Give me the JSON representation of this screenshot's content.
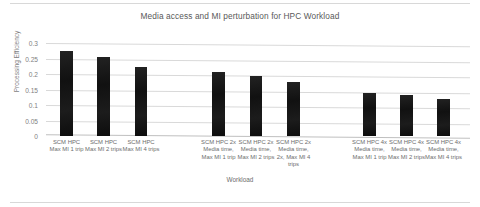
{
  "chart_data": {
    "type": "bar",
    "title": "Media access and MI perturbation for HPC Workload",
    "xlabel": "Workload",
    "ylabel": "Processing Efficiency",
    "ylim": [
      0,
      0.3
    ],
    "ytick_labels": [
      "0.3",
      "0.25",
      "0.2",
      "0.15",
      "0.1",
      "0.05",
      "0"
    ],
    "ytick_values": [
      0.3,
      0.25,
      0.2,
      0.15,
      0.1,
      0.05,
      0
    ],
    "grid": true,
    "legend": "none",
    "bar_color": "#151515",
    "categories": [
      "SCM HPC Max MI 1 trip",
      "SCM HPC Max MI 2 trips",
      "SCM HPC Max MI 4 trips",
      "SCM HPC 2x Media time, Max MI 1 trip",
      "SCM HPC 2x Media time, Max MI 2 trips",
      "SCM HPC 2x Media time, 2x, Max MI 4 trips",
      "SCM HPC 4x Media time, Max MI 1 trip",
      "SCM HPC 4x Media time, Max MI 2 trips",
      "SCM HPC 4x Media time, Max MI 4 trips"
    ],
    "values": [
      0.275,
      0.255,
      0.222,
      0.207,
      0.195,
      0.175,
      0.139,
      0.131,
      0.12
    ],
    "bars": [
      {
        "label": "SCM HPC Max MI 1 trip",
        "value": 0.275,
        "x": 14,
        "width": 13
      },
      {
        "label": "SCM HPC Max MI 2 trips",
        "value": 0.255,
        "x": 51,
        "width": 13
      },
      {
        "label": "SCM HPC Max MI 4 trips",
        "value": 0.222,
        "x": 89,
        "width": 12
      },
      {
        "label": "SCM HPC 2x Media time, Max MI 1 trip",
        "value": 0.207,
        "x": 166,
        "width": 13
      },
      {
        "label": "SCM HPC 2x Media time, Max MI 2 trips",
        "value": 0.195,
        "x": 204,
        "width": 12
      },
      {
        "label": "SCM HPC 2x Media time, 2x, Max MI 4 trips",
        "value": 0.175,
        "x": 241,
        "width": 13
      },
      {
        "label": "SCM HPC 4x Media time, Max MI 1 trip",
        "value": 0.139,
        "x": 317,
        "width": 13
      },
      {
        "label": "SCM HPC 4x Media time, Max MI 2 trips",
        "value": 0.131,
        "x": 354,
        "width": 13
      },
      {
        "label": "SCM HPC 4x Media time, Max MI 4 trips",
        "value": 0.12,
        "x": 391,
        "width": 13
      }
    ]
  }
}
